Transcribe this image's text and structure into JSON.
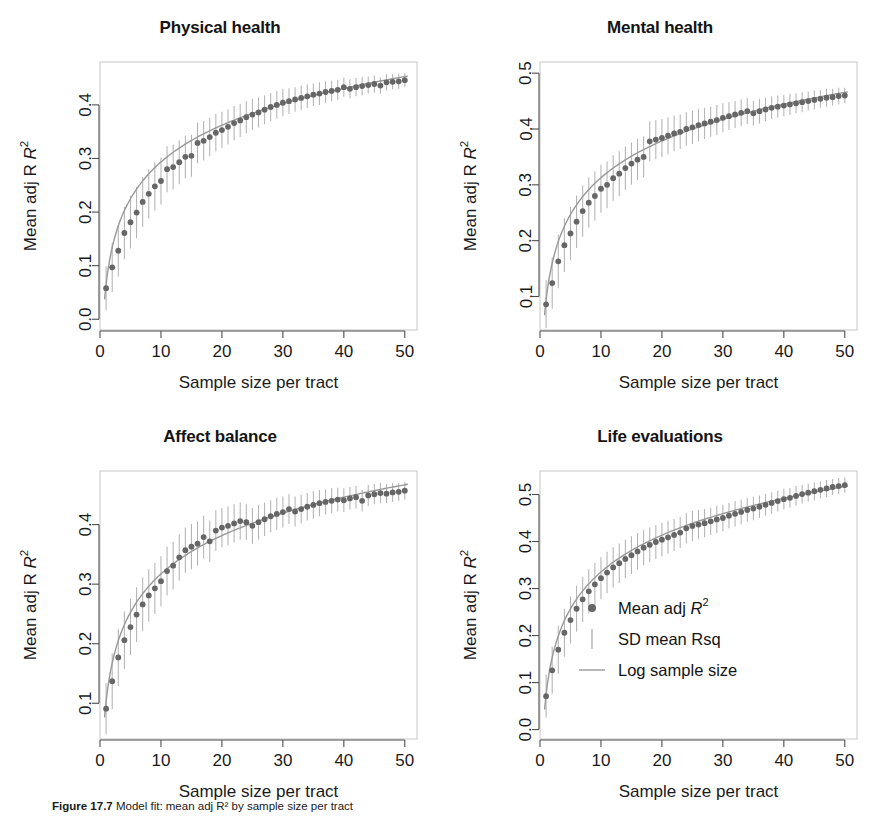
{
  "figure": {
    "caption_prefix": "Figure 17.7",
    "caption_text": "Model fit: mean adj R² by sample size per tract",
    "background": "#ffffff",
    "point_color": "#666666",
    "errorbar_color": "#b3b3b3",
    "curve_color": "#999999",
    "frame_color": "#cccccc",
    "axis_color": "#4d4d4d"
  },
  "shared": {
    "xlabel": "Sample size per tract",
    "ylabel": "Mean adj R",
    "ylabel_sup": "2",
    "xticks": [
      0,
      10,
      20,
      30,
      40,
      50
    ],
    "xlim": [
      0,
      52
    ],
    "x": [
      1,
      2,
      3,
      4,
      5,
      6,
      7,
      8,
      9,
      10,
      11,
      12,
      13,
      14,
      15,
      16,
      17,
      18,
      19,
      20,
      21,
      22,
      23,
      24,
      25,
      26,
      27,
      28,
      29,
      30,
      31,
      32,
      33,
      34,
      35,
      36,
      37,
      38,
      39,
      40,
      41,
      42,
      43,
      44,
      45,
      46,
      47,
      48,
      49,
      50
    ]
  },
  "legend": {
    "position": "bottom-right-panel",
    "items": [
      {
        "label_main": "Mean adj ",
        "label_italic": "R",
        "label_sup": "2",
        "marker": "point"
      },
      {
        "label_main": "SD mean Rsq",
        "label_italic": "",
        "label_sup": "",
        "marker": "errorbar"
      },
      {
        "label_main": "Log sample size",
        "label_italic": "",
        "label_sup": "",
        "marker": "line"
      }
    ]
  },
  "chart_data": [
    {
      "type": "scatter",
      "panel": "top-left",
      "title": "Physical health",
      "xlabel": "Sample size per tract",
      "ylabel": "Mean adj R2",
      "xlim": [
        0,
        52
      ],
      "ylim": [
        -0.02,
        0.48
      ],
      "yticks": [
        0.0,
        0.1,
        0.2,
        0.3,
        0.4
      ],
      "grid": false,
      "categories": [
        1,
        2,
        3,
        4,
        5,
        6,
        7,
        8,
        9,
        10,
        11,
        12,
        13,
        14,
        15,
        16,
        17,
        18,
        19,
        20,
        21,
        22,
        23,
        24,
        25,
        26,
        27,
        28,
        29,
        30,
        31,
        32,
        33,
        34,
        35,
        36,
        37,
        38,
        39,
        40,
        41,
        42,
        43,
        44,
        45,
        46,
        47,
        48,
        49,
        50
      ],
      "values": [
        0.058,
        0.097,
        0.128,
        0.161,
        0.181,
        0.199,
        0.219,
        0.234,
        0.248,
        0.258,
        0.28,
        0.284,
        0.293,
        0.303,
        0.305,
        0.329,
        0.333,
        0.34,
        0.348,
        0.353,
        0.359,
        0.366,
        0.371,
        0.377,
        0.382,
        0.386,
        0.391,
        0.396,
        0.4,
        0.404,
        0.407,
        0.41,
        0.413,
        0.416,
        0.419,
        0.421,
        0.424,
        0.426,
        0.428,
        0.433,
        0.43,
        0.433,
        0.435,
        0.437,
        0.439,
        0.436,
        0.442,
        0.443,
        0.444,
        0.446
      ],
      "errors": [
        0.041,
        0.046,
        0.048,
        0.049,
        0.049,
        0.048,
        0.047,
        0.046,
        0.045,
        0.044,
        0.043,
        0.042,
        0.041,
        0.04,
        0.039,
        0.038,
        0.037,
        0.036,
        0.035,
        0.034,
        0.033,
        0.032,
        0.031,
        0.03,
        0.029,
        0.028,
        0.027,
        0.026,
        0.026,
        0.025,
        0.024,
        0.023,
        0.023,
        0.022,
        0.021,
        0.021,
        0.02,
        0.019,
        0.019,
        0.018,
        0.018,
        0.017,
        0.017,
        0.016,
        0.016,
        0.015,
        0.015,
        0.014,
        0.014,
        0.013
      ],
      "fit_label": "Log sample size",
      "fit_a": 0.0655,
      "fit_b": 0.099
    },
    {
      "type": "scatter",
      "panel": "top-right",
      "title": "Mental health",
      "xlabel": "Sample size per tract",
      "ylabel": "Mean adj R2",
      "xlim": [
        0,
        52
      ],
      "ylim": [
        0.04,
        0.52
      ],
      "yticks": [
        0.1,
        0.2,
        0.3,
        0.4,
        0.5
      ],
      "grid": false,
      "categories": [
        1,
        2,
        3,
        4,
        5,
        6,
        7,
        8,
        9,
        10,
        11,
        12,
        13,
        14,
        15,
        16,
        17,
        18,
        19,
        20,
        21,
        22,
        23,
        24,
        25,
        26,
        27,
        28,
        29,
        30,
        31,
        32,
        33,
        34,
        35,
        36,
        37,
        38,
        39,
        40,
        41,
        42,
        43,
        44,
        45,
        46,
        47,
        48,
        49,
        50
      ],
      "values": [
        0.086,
        0.124,
        0.163,
        0.192,
        0.213,
        0.234,
        0.253,
        0.268,
        0.28,
        0.293,
        0.3,
        0.312,
        0.32,
        0.33,
        0.338,
        0.345,
        0.35,
        0.378,
        0.381,
        0.384,
        0.388,
        0.392,
        0.395,
        0.4,
        0.403,
        0.407,
        0.41,
        0.413,
        0.416,
        0.42,
        0.423,
        0.426,
        0.429,
        0.432,
        0.428,
        0.432,
        0.435,
        0.438,
        0.44,
        0.442,
        0.444,
        0.446,
        0.448,
        0.45,
        0.452,
        0.454,
        0.456,
        0.457,
        0.459,
        0.46
      ],
      "errors": [
        0.043,
        0.046,
        0.048,
        0.048,
        0.048,
        0.047,
        0.046,
        0.045,
        0.044,
        0.043,
        0.042,
        0.041,
        0.04,
        0.039,
        0.038,
        0.037,
        0.037,
        0.036,
        0.035,
        0.034,
        0.033,
        0.032,
        0.031,
        0.03,
        0.03,
        0.029,
        0.028,
        0.027,
        0.027,
        0.026,
        0.025,
        0.024,
        0.024,
        0.023,
        0.022,
        0.022,
        0.021,
        0.02,
        0.02,
        0.019,
        0.019,
        0.018,
        0.018,
        0.017,
        0.017,
        0.016,
        0.016,
        0.015,
        0.015,
        0.014
      ],
      "fit_label": "Log sample size",
      "fit_a": 0.094,
      "fit_b": 0.095
    },
    {
      "type": "scatter",
      "panel": "bottom-left",
      "title": "Affect balance",
      "xlabel": "Sample size per tract",
      "ylabel": "Mean adj R2",
      "xlim": [
        0,
        52
      ],
      "ylim": [
        0.04,
        0.49
      ],
      "yticks": [
        0.1,
        0.2,
        0.3,
        0.4
      ],
      "grid": false,
      "categories": [
        1,
        2,
        3,
        4,
        5,
        6,
        7,
        8,
        9,
        10,
        11,
        12,
        13,
        14,
        15,
        16,
        17,
        18,
        19,
        20,
        21,
        22,
        23,
        24,
        25,
        26,
        27,
        28,
        29,
        30,
        31,
        32,
        33,
        34,
        35,
        36,
        37,
        38,
        39,
        40,
        41,
        42,
        43,
        44,
        45,
        46,
        47,
        48,
        49,
        50
      ],
      "values": [
        0.091,
        0.137,
        0.177,
        0.206,
        0.228,
        0.249,
        0.266,
        0.281,
        0.293,
        0.305,
        0.322,
        0.331,
        0.345,
        0.357,
        0.363,
        0.368,
        0.379,
        0.372,
        0.39,
        0.395,
        0.398,
        0.402,
        0.406,
        0.404,
        0.398,
        0.404,
        0.409,
        0.414,
        0.418,
        0.421,
        0.426,
        0.422,
        0.426,
        0.43,
        0.433,
        0.436,
        0.438,
        0.44,
        0.442,
        0.441,
        0.444,
        0.446,
        0.44,
        0.449,
        0.451,
        0.453,
        0.452,
        0.454,
        0.455,
        0.457
      ],
      "errors": [
        0.043,
        0.047,
        0.048,
        0.048,
        0.047,
        0.046,
        0.045,
        0.044,
        0.043,
        0.042,
        0.041,
        0.04,
        0.039,
        0.038,
        0.038,
        0.037,
        0.036,
        0.035,
        0.034,
        0.033,
        0.033,
        0.032,
        0.031,
        0.03,
        0.03,
        0.029,
        0.028,
        0.027,
        0.027,
        0.026,
        0.025,
        0.025,
        0.024,
        0.023,
        0.023,
        0.022,
        0.021,
        0.021,
        0.02,
        0.02,
        0.019,
        0.019,
        0.018,
        0.018,
        0.017,
        0.017,
        0.016,
        0.016,
        0.015,
        0.015
      ],
      "fit_label": "Log sample size",
      "fit_a": 0.103,
      "fit_b": 0.093
    },
    {
      "type": "scatter",
      "panel": "bottom-right",
      "title": "Life evaluations",
      "xlabel": "Sample size per tract",
      "ylabel": "Mean adj R2",
      "xlim": [
        0,
        52
      ],
      "ylim": [
        -0.02,
        0.55
      ],
      "yticks": [
        0.0,
        0.1,
        0.2,
        0.3,
        0.4,
        0.5
      ],
      "grid": false,
      "categories": [
        1,
        2,
        3,
        4,
        5,
        6,
        7,
        8,
        9,
        10,
        11,
        12,
        13,
        14,
        15,
        16,
        17,
        18,
        19,
        20,
        21,
        22,
        23,
        24,
        25,
        26,
        27,
        28,
        29,
        30,
        31,
        32,
        33,
        34,
        35,
        36,
        37,
        38,
        39,
        40,
        41,
        42,
        43,
        44,
        45,
        46,
        47,
        48,
        49,
        50
      ],
      "values": [
        0.071,
        0.126,
        0.17,
        0.206,
        0.233,
        0.257,
        0.277,
        0.294,
        0.309,
        0.322,
        0.334,
        0.345,
        0.354,
        0.363,
        0.371,
        0.379,
        0.387,
        0.393,
        0.399,
        0.404,
        0.409,
        0.414,
        0.419,
        0.428,
        0.433,
        0.436,
        0.439,
        0.443,
        0.447,
        0.45,
        0.455,
        0.459,
        0.463,
        0.467,
        0.47,
        0.474,
        0.478,
        0.482,
        0.486,
        0.49,
        0.493,
        0.497,
        0.501,
        0.504,
        0.507,
        0.51,
        0.513,
        0.516,
        0.518,
        0.52
      ],
      "errors": [
        0.046,
        0.05,
        0.051,
        0.051,
        0.05,
        0.049,
        0.048,
        0.047,
        0.046,
        0.045,
        0.044,
        0.043,
        0.042,
        0.041,
        0.04,
        0.039,
        0.038,
        0.037,
        0.036,
        0.036,
        0.035,
        0.034,
        0.033,
        0.032,
        0.032,
        0.031,
        0.03,
        0.029,
        0.029,
        0.028,
        0.027,
        0.027,
        0.026,
        0.025,
        0.025,
        0.024,
        0.023,
        0.023,
        0.022,
        0.022,
        0.021,
        0.021,
        0.02,
        0.019,
        0.019,
        0.018,
        0.018,
        0.017,
        0.017,
        0.016
      ],
      "fit_label": "Log sample size",
      "fit_a": 0.075,
      "fit_b": 0.113
    }
  ]
}
